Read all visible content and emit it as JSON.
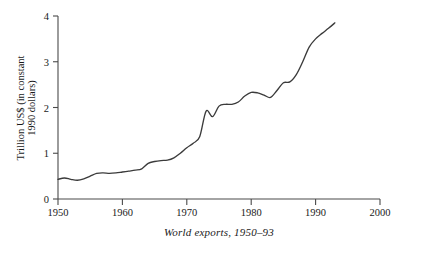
{
  "chart_data": {
    "type": "line",
    "title": "",
    "caption": "World exports, 1950–93",
    "xlabel": "",
    "ylabel_line1": "Trillion US$ (in constant",
    "ylabel_line2": "1990 dollars)",
    "xlim": [
      1950,
      2000
    ],
    "ylim": [
      0,
      4
    ],
    "xticks": [
      1950,
      1960,
      1970,
      1980,
      1990,
      2000
    ],
    "xtick_labels": [
      "1950",
      "1960",
      "1970",
      "1980",
      "1990",
      "2000"
    ],
    "yticks": [
      0,
      1,
      2,
      3,
      4
    ],
    "ytick_labels": [
      "0",
      "1",
      "2",
      "3",
      "4"
    ],
    "grid": false,
    "legend": "none",
    "line_color": "#3b3b3b",
    "axis_color": "#4a4a4a",
    "background_color": "#ffffff",
    "series": [
      {
        "name": "World exports",
        "units": "Trillion constant 1990 US$",
        "x": [
          1950,
          1951,
          1952,
          1953,
          1954,
          1955,
          1956,
          1957,
          1958,
          1959,
          1960,
          1961,
          1962,
          1963,
          1964,
          1965,
          1966,
          1967,
          1968,
          1969,
          1970,
          1971,
          1972,
          1973,
          1974,
          1975,
          1976,
          1977,
          1978,
          1979,
          1980,
          1981,
          1982,
          1983,
          1984,
          1985,
          1986,
          1987,
          1988,
          1989,
          1990,
          1991,
          1992,
          1993
        ],
        "values": [
          0.43,
          0.46,
          0.43,
          0.41,
          0.44,
          0.5,
          0.56,
          0.57,
          0.56,
          0.57,
          0.59,
          0.61,
          0.63,
          0.66,
          0.78,
          0.82,
          0.84,
          0.85,
          0.9,
          1.0,
          1.12,
          1.22,
          1.36,
          1.92,
          1.8,
          2.03,
          2.07,
          2.07,
          2.12,
          2.25,
          2.33,
          2.32,
          2.27,
          2.22,
          2.37,
          2.54,
          2.56,
          2.72,
          3.0,
          3.32,
          3.5,
          3.62,
          3.73,
          3.85
        ]
      }
    ]
  },
  "figure": {
    "caption": "World exports, 1950–93",
    "ylabel_line1": "Trillion US$ (in constant",
    "ylabel_line2": "1990 dollars)",
    "top_cut_text": ""
  },
  "axes": {
    "x_tick_labels": [
      "1950",
      "1960",
      "1970",
      "1980",
      "1990",
      "2000"
    ],
    "y_tick_labels": [
      "0",
      "1",
      "2",
      "3",
      "4"
    ]
  }
}
